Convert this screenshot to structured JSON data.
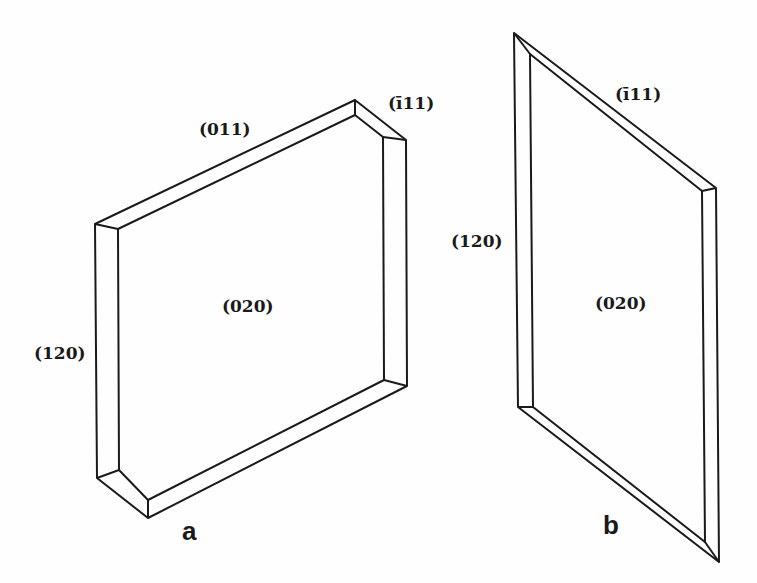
{
  "figure": {
    "type": "crystal morphology diagram",
    "panels": [
      {
        "id": "a",
        "label": "a",
        "faces": {
          "top_edge": "(011)",
          "corner_edge": "(ī11)",
          "left_edge": "(120)",
          "main_face": "(020)"
        }
      },
      {
        "id": "b",
        "label": "b",
        "faces": {
          "top_edge": "(ī11)",
          "left_edge": "(120)",
          "main_face": "(020)"
        }
      }
    ]
  },
  "colors": {
    "line": "#1a1a1a",
    "background": "#fefefe"
  }
}
